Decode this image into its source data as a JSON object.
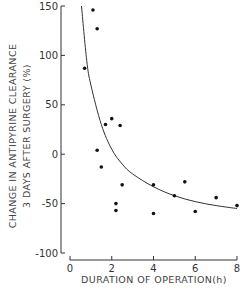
{
  "chart_data": {
    "type": "scatter",
    "title": "",
    "xlabel": "DURATION OF OPERATION(h)",
    "ylabel_line1": "CHANGE IN ANTIPYRINE CLEARANCE",
    "ylabel_line2": "3 DAYS AFTER SURGERY (%)",
    "xlim": [
      0,
      8
    ],
    "ylim": [
      -100,
      150
    ],
    "xticks": [
      0,
      2,
      4,
      6,
      8
    ],
    "yticks": [
      150,
      100,
      50,
      0,
      -50,
      -100
    ],
    "grid": false,
    "legend": null,
    "series": [
      {
        "name": "patients",
        "points": [
          {
            "x": 0.7,
            "y": 87
          },
          {
            "x": 1.1,
            "y": 146
          },
          {
            "x": 1.3,
            "y": 127
          },
          {
            "x": 1.3,
            "y": 4
          },
          {
            "x": 1.5,
            "y": -13
          },
          {
            "x": 1.7,
            "y": 30
          },
          {
            "x": 2.0,
            "y": 36
          },
          {
            "x": 2.4,
            "y": 29
          },
          {
            "x": 2.5,
            "y": -31
          },
          {
            "x": 2.2,
            "y": -50
          },
          {
            "x": 2.2,
            "y": -57
          },
          {
            "x": 4.0,
            "y": -31
          },
          {
            "x": 4.0,
            "y": -60
          },
          {
            "x": 5.0,
            "y": -42
          },
          {
            "x": 5.5,
            "y": -28
          },
          {
            "x": 6.0,
            "y": -58
          },
          {
            "x": 7.0,
            "y": -44
          },
          {
            "x": 8.0,
            "y": -52
          }
        ]
      },
      {
        "name": "fitted curve",
        "type": "line",
        "points": [
          {
            "x": 0.55,
            "y": 150
          },
          {
            "x": 0.8,
            "y": 95
          },
          {
            "x": 1.0,
            "y": 70
          },
          {
            "x": 1.5,
            "y": 30
          },
          {
            "x": 2.0,
            "y": 5
          },
          {
            "x": 2.5,
            "y": -10
          },
          {
            "x": 3.0,
            "y": -20
          },
          {
            "x": 4.0,
            "y": -33
          },
          {
            "x": 5.0,
            "y": -42
          },
          {
            "x": 6.0,
            "y": -48
          },
          {
            "x": 7.0,
            "y": -52
          },
          {
            "x": 8.0,
            "y": -55
          }
        ]
      }
    ]
  }
}
